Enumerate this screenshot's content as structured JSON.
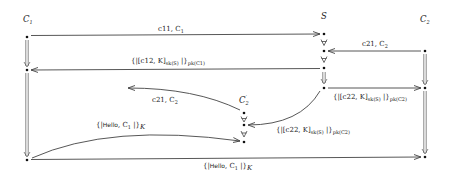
{
  "diagram": {
    "type": "protocol-message-sequence",
    "roles": [
      {
        "id": "C1",
        "label": "C",
        "sub": "1",
        "x": 27,
        "y": 20
      },
      {
        "id": "S",
        "label": "S",
        "sub": "",
        "x": 324,
        "y": 17
      },
      {
        "id": "C2",
        "label": "C",
        "sub": "2",
        "x": 425,
        "y": 20
      },
      {
        "id": "C2p",
        "label": "C",
        "sub": "2",
        "prime": "′",
        "x": 244,
        "y": 101
      }
    ],
    "messages": [
      {
        "id": "m1",
        "from": "C1",
        "to": "S",
        "text": "c11, C",
        "text_sub": "1"
      },
      {
        "id": "m2",
        "from": "C2",
        "to": "S",
        "text": "c21, C",
        "text_sub": "2"
      },
      {
        "id": "m3",
        "from": "S",
        "to": "C1",
        "text_pre": "{|[c12, K]",
        "text_sub1": "sk(S)",
        "text_mid": " |}",
        "text_sub2": "pk(C",
        "text_sub2b": "1",
        "text_end": ")"
      },
      {
        "id": "m4",
        "from": "S",
        "to": "C2",
        "text_pre": "{|[c22, K]",
        "text_sub1": "sk(S)",
        "text_mid": " |}",
        "text_sub2": "pk(C",
        "text_sub2b": "2",
        "text_end": ")"
      },
      {
        "id": "m5",
        "from": "S",
        "to": "C2p",
        "text_pre": "{|[c22, K]",
        "text_sub1": "sk(S)",
        "text_mid": " |}",
        "text_sub2": "pk(C",
        "text_sub2b": "2",
        "text_end": ")"
      },
      {
        "id": "m6",
        "from": "C2p",
        "to": "out",
        "text": "c21, C",
        "text_sub": "2"
      },
      {
        "id": "m7",
        "from": "C1",
        "to": "C2p",
        "text_pre": "{|",
        "hello": "Hello",
        "text_post": ", C",
        "text_sub": "1",
        "text_end": " |}",
        "key": "K"
      },
      {
        "id": "m8",
        "from": "C1",
        "to": "C2",
        "text_pre": "{|",
        "hello": "Hello",
        "text_post": ", C",
        "text_sub": "1",
        "text_end": " |}",
        "key": "K"
      }
    ]
  }
}
